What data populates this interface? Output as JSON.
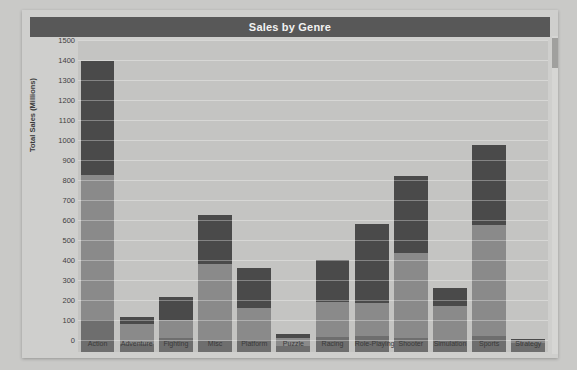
{
  "chart_data": {
    "type": "bar",
    "barmode": "stacked",
    "title": "Sales by Genre",
    "xlabel": "",
    "ylabel": "Total Sales (Millions)",
    "ylim": [
      0,
      1500
    ],
    "ytick_step": 100,
    "yticks": [
      1500,
      1400,
      1300,
      1200,
      1100,
      1000,
      900,
      800,
      700,
      600,
      500,
      400,
      300,
      200,
      100,
      0
    ],
    "grid": true,
    "legend_position": "none",
    "categories": [
      "Action",
      "Adventure",
      "Fighting",
      "Misc",
      "Platform",
      "Puzzle",
      "Racing",
      "Role-Playing",
      "Shooter",
      "Simulation",
      "Sports",
      "Strategy"
    ],
    "series": [
      {
        "name": "bottom-segment",
        "color": "#6e6e6e",
        "values": [
          160,
          42,
          70,
          55,
          60,
          30,
          75,
          80,
          70,
          55,
          80,
          45
        ]
      },
      {
        "name": "middle-segment",
        "color": "#8a8a8a",
        "values": [
          725,
          100,
          90,
          385,
          160,
          40,
          175,
          165,
          425,
          175,
          555,
          15
        ]
      },
      {
        "name": "top-segment",
        "color": "#4a4a4a",
        "values": [
          570,
          33,
          115,
          245,
          200,
          20,
          210,
          395,
          385,
          90,
          400,
          5
        ]
      }
    ],
    "totals": [
      1455,
      175,
      275,
      685,
      420,
      90,
      460,
      640,
      880,
      320,
      1035,
      65
    ]
  },
  "colors": {
    "page_background": "#c9c9c7",
    "chart_background": "#cfcfcd",
    "plot_background": "#c4c4c2",
    "title_bar": "#585858",
    "title_text": "#f2f2f2",
    "segment_dark": "#4a4a4a",
    "segment_mid": "#8a8a8a",
    "segment_light": "#6e6e6e",
    "gridline": "rgba(255,255,255,0.32)",
    "axis_text": "#3f3f3f"
  },
  "scrollbar": {
    "name": "vertical-scrollbar",
    "thumb_position_percent": 1
  },
  "background_page_text": "a b c  d e f g h i j  k l m n o p\nq r s t u v w x y z  a b c d e f g h i j k l\nm n o p q r s t u v  w x y z a b c d e f g h\n\nA B C D E F G H I J K L M N O P Q R S T U V W X Y Z\na b c d e f g h i j k l m n o p q r s t u v w x y z\n\n\n\n\n\n\n\n\n\n\n\nS e c  O\n\n\n\n\n\n\n\n\n\n\n\n\n\n\n\n\n\n\n\n\n\n\n\n\n\n\n\n\n"
}
